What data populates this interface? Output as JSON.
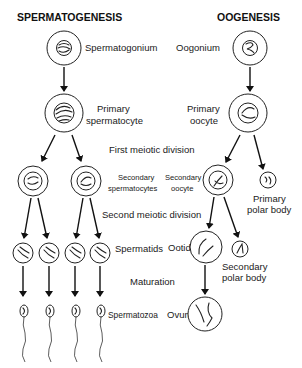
{
  "titles": {
    "left": "SPERMATOGENESIS",
    "right": "OOGENESIS"
  },
  "stages": {
    "first_meiotic": "First meiotic division",
    "second_meiotic": "Second meiotic division",
    "maturation": "Maturation"
  },
  "spermatogenesis": {
    "spermatogonium": "Spermatogonium",
    "primary_1": "Primary",
    "primary_2": "spermatocyte",
    "secondary_1": "Secondary",
    "secondary_2": "spermatocytes",
    "spermatids": "Spermatids",
    "spermatozoa": "Spermatozoa"
  },
  "oogenesis": {
    "oogonium": "Oogonium",
    "primary_1": "Primary",
    "primary_2": "oocyte",
    "secondary_1": "Secondary",
    "secondary_2": "oocyte",
    "primary_polar_1": "Primary",
    "primary_polar_2": "polar body",
    "ootid": "Ootid",
    "secondary_polar_1": "Secondary",
    "secondary_polar_2": "polar body",
    "ovum": "Ovum"
  },
  "colors": {
    "line": "#222222",
    "background": "#ffffff"
  }
}
